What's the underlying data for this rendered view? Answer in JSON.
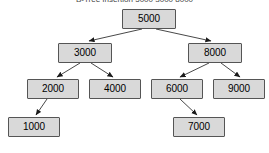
{
  "figure": {
    "caption": "B-Tree Insertion 5000 3000 8000",
    "caption_visible": "partially-cut-off",
    "background_color": "#ffffff"
  },
  "style": {
    "node_fill": "#d9d9d9",
    "node_border": "#555555",
    "edge_color": "#333333",
    "text_color": "#000000",
    "node_width": 54,
    "node_height": 20
  },
  "tree": {
    "type": "binary-search-tree",
    "root": "5000",
    "nodes": [
      {
        "id": "n5000",
        "label": "5000",
        "x": 122,
        "y": 9,
        "w": 54,
        "h": 20,
        "level": 0
      },
      {
        "id": "n3000",
        "label": "3000",
        "x": 58,
        "y": 43,
        "w": 54,
        "h": 20,
        "level": 1
      },
      {
        "id": "n8000",
        "label": "8000",
        "x": 188,
        "y": 43,
        "w": 54,
        "h": 20,
        "level": 1
      },
      {
        "id": "n2000",
        "label": "2000",
        "x": 27,
        "y": 79,
        "w": 52,
        "h": 20,
        "level": 2
      },
      {
        "id": "n4000",
        "label": "4000",
        "x": 89,
        "y": 79,
        "w": 52,
        "h": 20,
        "level": 2
      },
      {
        "id": "n6000",
        "label": "6000",
        "x": 151,
        "y": 79,
        "w": 52,
        "h": 20,
        "level": 2
      },
      {
        "id": "n9000",
        "label": "9000",
        "x": 213,
        "y": 79,
        "w": 52,
        "h": 20,
        "level": 2
      },
      {
        "id": "n1000",
        "label": "1000",
        "x": 8,
        "y": 117,
        "w": 52,
        "h": 20,
        "level": 3
      },
      {
        "id": "n7000",
        "label": "7000",
        "x": 173,
        "y": 117,
        "w": 52,
        "h": 20,
        "level": 3
      }
    ],
    "edges": [
      {
        "from": "n5000",
        "to": "n3000",
        "side": "left",
        "x1": 142,
        "y1": 29,
        "x2": 89,
        "y2": 41
      },
      {
        "from": "n5000",
        "to": "n8000",
        "side": "right",
        "x1": 156,
        "y1": 29,
        "x2": 211,
        "y2": 41
      },
      {
        "from": "n3000",
        "to": "n2000",
        "side": "left",
        "x1": 80,
        "y1": 63,
        "x2": 57,
        "y2": 77
      },
      {
        "from": "n3000",
        "to": "n4000",
        "side": "right",
        "x1": 91,
        "y1": 63,
        "x2": 113,
        "y2": 77
      },
      {
        "from": "n8000",
        "to": "n6000",
        "side": "left",
        "x1": 209,
        "y1": 63,
        "x2": 180,
        "y2": 77
      },
      {
        "from": "n8000",
        "to": "n9000",
        "side": "right",
        "x1": 221,
        "y1": 63,
        "x2": 240,
        "y2": 77
      },
      {
        "from": "n2000",
        "to": "n1000",
        "side": "left",
        "x1": 47,
        "y1": 99,
        "x2": 36,
        "y2": 115
      },
      {
        "from": "n6000",
        "to": "n7000",
        "side": "right",
        "x1": 180,
        "y1": 99,
        "x2": 197,
        "y2": 115
      }
    ]
  }
}
